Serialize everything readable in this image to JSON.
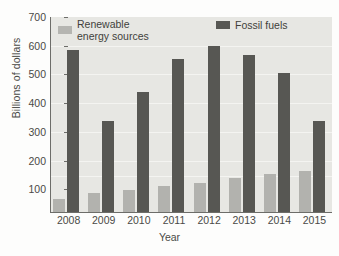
{
  "chart_data": {
    "type": "bar",
    "title": "",
    "xlabel": "Year",
    "ylabel": "Billions of dollars",
    "categories": [
      "2008",
      "2009",
      "2010",
      "2011",
      "2012",
      "2013",
      "2014",
      "2015"
    ],
    "series": [
      {
        "name": "Renewable energy sources",
        "color": "#b2b2ae",
        "values": [
          45,
          68,
          78,
          92,
          105,
          122,
          138,
          147
        ]
      },
      {
        "name": "Fossil fuels",
        "color": "#575753",
        "values": [
          583,
          328,
          430,
          550,
          595,
          565,
          500,
          325
        ]
      }
    ],
    "ylim": [
      0,
      700
    ],
    "ytick_labels": [
      "100",
      "200",
      "300",
      "400",
      "500",
      "600",
      "700"
    ],
    "ytick_values": [
      100,
      200,
      300,
      400,
      500,
      600,
      700
    ],
    "grid": true,
    "legend_position": "top-left-inside"
  },
  "legend": {
    "renewable_line1": "Renewable",
    "renewable_line2": "energy sources",
    "fossil": "Fossil fuels"
  },
  "colors": {
    "plot_background": "#e7e7e3",
    "page_background": "#fdfdfc",
    "axis": "#6d6d69",
    "renewable": "#b2b2ae",
    "fossil": "#575753",
    "text": "#4a4a46"
  },
  "scan_artifact": {
    "bleed_text": ""
  }
}
